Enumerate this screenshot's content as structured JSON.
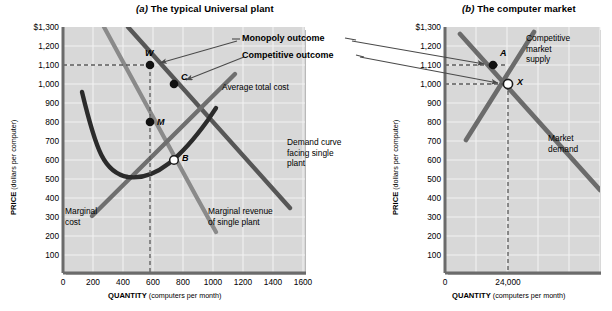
{
  "figure": {
    "panel_a": {
      "title_letter": "(a)",
      "title_text": " The typical Universal plant",
      "y_axis_label_bold": "PRICE",
      "y_axis_label_sub": " (dollars per computer)",
      "x_axis_label_bold": "QUANTITY",
      "x_axis_label_sub": " (computers per month)",
      "y_ticks": [
        "$1,300",
        "1,200",
        "1,100",
        "1,000",
        "900",
        "800",
        "700",
        "600",
        "500",
        "400",
        "300",
        "200",
        "100"
      ],
      "x_ticks": [
        "0",
        "200",
        "400",
        "600",
        "800",
        "1000",
        "1200",
        "1400",
        "1600"
      ],
      "curve_labels": {
        "atc": "Average total cost",
        "demand": "Demand curve\nfacing single\nplant",
        "mr": "Marginal revenue\nof single plant",
        "mc": "Marginal\ncost"
      },
      "points": [
        {
          "id": "W",
          "label": "W",
          "price": 1100,
          "quantity": 470,
          "filled": true
        },
        {
          "id": "C",
          "label": "C",
          "price": 1000,
          "quantity": 600,
          "filled": true
        },
        {
          "id": "M",
          "label": "M",
          "price": 750,
          "quantity": 470,
          "filled": true
        },
        {
          "id": "B",
          "label": "B",
          "price": 550,
          "quantity": 600,
          "filled": false
        }
      ],
      "dashed_price_line": 1100,
      "dashed_quantity_line": 470
    },
    "panel_b": {
      "title_letter": "(b)",
      "title_text": " The computer market",
      "y_axis_label_bold": "PRICE",
      "y_axis_label_sub": " (dollars per computer)",
      "x_axis_label_bold": "QUANTITY",
      "x_axis_label_sub": " (computers per month)",
      "y_ticks": [
        "$1,300",
        "1,200",
        "1,100",
        "1,000",
        "900",
        "800",
        "700",
        "600",
        "500",
        "400",
        "300",
        "200",
        "100"
      ],
      "x_ticks": [
        "0",
        "24,000"
      ],
      "curve_labels": {
        "supply": "Competitive\nmarket\nsupply",
        "demand": "Market\ndemand"
      },
      "points": [
        {
          "id": "A",
          "label": "A",
          "price": 1100,
          "quantity": 20500,
          "filled": true
        },
        {
          "id": "X",
          "label": "X",
          "price": 1000,
          "quantity": 24000,
          "filled": false
        }
      ],
      "dashed_price_lines": [
        1100,
        1000
      ],
      "dashed_quantity_line": 24000
    },
    "callouts": [
      {
        "id": "monopoly",
        "text": "Monopoly outcome"
      },
      {
        "id": "competitive",
        "text": "Competitive outcome"
      }
    ],
    "colors": {
      "plot_background": "#d8d8d8",
      "grid_line": "#f2f2f2",
      "axis_line": "#6b6b6b",
      "atc_curve": "#2b2b2b",
      "demand_curve": "#585858",
      "mr_curve": "#7d7d7d",
      "mc_curve": "#6e6e6e",
      "point_fill": "#111111",
      "point_open": "#ffffff",
      "dash_line": "#5a5a5a",
      "text": "#000000"
    }
  }
}
